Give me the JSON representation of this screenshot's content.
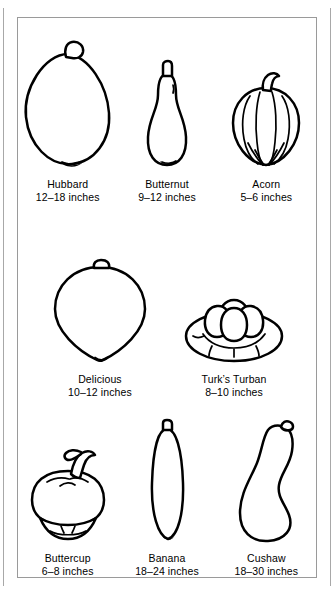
{
  "figure": {
    "ink_color": "#000000",
    "frame_color": "#9a9a9a",
    "background": "#ffffff"
  },
  "rows": [
    {
      "items": [
        {
          "name": "Hubbard",
          "size": "12–18 inches",
          "icon": "hubbard-squash-illustration"
        },
        {
          "name": "Butternut",
          "size": "9–12 inches",
          "icon": "butternut-squash-illustration"
        },
        {
          "name": "Acorn",
          "size": "5–6 inches",
          "icon": "acorn-squash-illustration"
        }
      ]
    },
    {
      "items": [
        {
          "name": "Delicious",
          "size": "10–12 inches",
          "icon": "delicious-squash-illustration"
        },
        {
          "name": "Turk’s Turban",
          "size": "8–10 inches",
          "icon": "turks-turban-squash-illustration"
        }
      ]
    },
    {
      "items": [
        {
          "name": "Buttercup",
          "size": "6–8 inches",
          "icon": "buttercup-squash-illustration"
        },
        {
          "name": "Banana",
          "size": "18–24 inches",
          "icon": "banana-squash-illustration"
        },
        {
          "name": "Cushaw",
          "size": "18–30 inches",
          "icon": "cushaw-squash-illustration"
        }
      ]
    }
  ]
}
